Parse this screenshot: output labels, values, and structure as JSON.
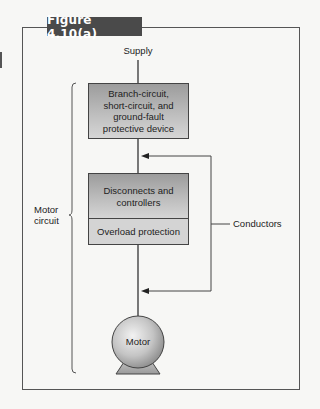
{
  "figure": {
    "label": "Figure 4.10(a)",
    "label_bg": "#4a4a4a",
    "label_color": "#ffffff"
  },
  "diagram": {
    "supply_label": "Supply",
    "boxes": [
      {
        "id": "protective-device",
        "text": "Branch-circuit, short-circuit, and ground-fault protective device",
        "lines": [
          "Branch-circuit,",
          "short-circuit, and",
          "ground-fault",
          "protective device"
        ]
      },
      {
        "id": "disconnects",
        "text": "Disconnects and controllers",
        "lines": [
          "Disconnects and",
          "controllers"
        ]
      },
      {
        "id": "overload",
        "text": "Overload protection",
        "lines": [
          "Overload protection"
        ]
      }
    ],
    "motor_label": "Motor",
    "conductors_label": "Conductors",
    "motor_circuit_label": {
      "lines": [
        "Motor",
        "circuit"
      ]
    },
    "colors": {
      "line": "#333333",
      "box_gradient_top": "#9c9c9c",
      "box_gradient_bottom": "#d6d6d6",
      "overload_fill": "#d4d4d4",
      "motor_fill": "#c8c8c8"
    }
  }
}
